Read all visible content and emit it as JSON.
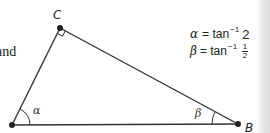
{
  "figure": {
    "vertices": {
      "A": {
        "label": "A",
        "x": 12,
        "y": 125
      },
      "B": {
        "label": "B",
        "x": 238,
        "y": 124
      },
      "C": {
        "label": "C",
        "x": 60,
        "y": 28
      }
    },
    "right_angle_at": "C",
    "angles": {
      "alpha": {
        "symbol": "α",
        "at": "A"
      },
      "beta": {
        "symbol": "β",
        "at": "B"
      }
    },
    "line_color": "#333333"
  },
  "text": {
    "and_fragment": "and",
    "vertex_c": "C",
    "vertex_b": "B",
    "angle_alpha": "α",
    "angle_beta": "β"
  },
  "formulas": [
    {
      "lhs": "α",
      "eq": "= tan",
      "exp": "−1",
      "rhs": "2"
    },
    {
      "lhs": "β",
      "eq": "= tan",
      "exp": "−1",
      "rhs_num": "1",
      "rhs_den": "2"
    }
  ]
}
